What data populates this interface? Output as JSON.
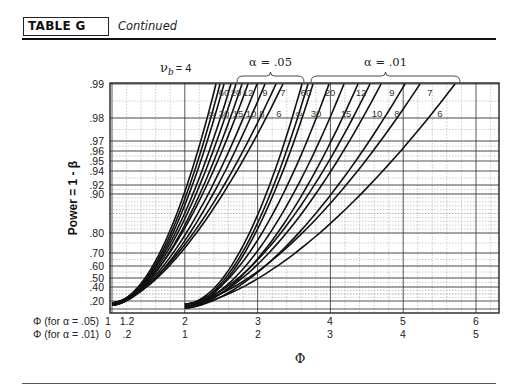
{
  "header": {
    "table_label": "TABLE G",
    "subtitle": "Continued"
  },
  "chart_data": {
    "type": "line",
    "nu_b_label": "ν",
    "nu_b_sub": "b",
    "nu_b_value": "= 4",
    "ylabel": "Power = 1 - β",
    "xlabel": "Φ",
    "x_axis_rows": [
      {
        "label": "Φ (for α = .05)",
        "ticks": [
          "1",
          "1.2",
          "2",
          "3",
          "4",
          "5",
          "6"
        ],
        "values": [
          1,
          1.2,
          2,
          3,
          4,
          5,
          6
        ]
      },
      {
        "label": "Φ (for α = .01)",
        "ticks": [
          "0",
          ".2",
          "1",
          "2",
          "3",
          "4",
          "5"
        ],
        "values": [
          0,
          0.2,
          1,
          2,
          3,
          4,
          5
        ]
      }
    ],
    "y_ticks": [
      ".99",
      ".98",
      ".97",
      ".96",
      ".95",
      ".94",
      ".92",
      ".90",
      ".80",
      ".70",
      ".60",
      ".50",
      ".40",
      ".20"
    ],
    "y_tick_values": [
      0.99,
      0.98,
      0.97,
      0.96,
      0.95,
      0.94,
      0.92,
      0.9,
      0.8,
      0.7,
      0.6,
      0.5,
      0.4,
      0.2
    ],
    "groups": [
      {
        "name": "α = .05",
        "df_top_labels": [
          "60",
          "20",
          "12",
          "9",
          "7"
        ],
        "df_mid_labels": [
          "∞",
          "30",
          "15",
          "10",
          "8",
          "6"
        ],
        "series": [
          {
            "df": "∞",
            "phi_at_power_020": 1.0,
            "phi_at_power_099": 2.42
          },
          {
            "df": "60",
            "phi_at_power_020": 1.0,
            "phi_at_power_099": 2.48
          },
          {
            "df": "30",
            "phi_at_power_020": 1.0,
            "phi_at_power_099": 2.54
          },
          {
            "df": "20",
            "phi_at_power_020": 1.0,
            "phi_at_power_099": 2.62
          },
          {
            "df": "15",
            "phi_at_power_020": 1.0,
            "phi_at_power_099": 2.7
          },
          {
            "df": "12",
            "phi_at_power_020": 1.0,
            "phi_at_power_099": 2.78
          },
          {
            "df": "10",
            "phi_at_power_020": 1.0,
            "phi_at_power_099": 2.87
          },
          {
            "df": "9",
            "phi_at_power_020": 1.0,
            "phi_at_power_099": 2.97
          },
          {
            "df": "8",
            "phi_at_power_020": 1.0,
            "phi_at_power_099": 3.1
          },
          {
            "df": "7",
            "phi_at_power_020": 1.0,
            "phi_at_power_099": 3.26
          },
          {
            "df": "6",
            "phi_at_power_020": 1.0,
            "phi_at_power_099": 3.48
          }
        ]
      },
      {
        "name": "α = .01",
        "df_top_labels": [
          "60",
          "20",
          "12",
          "9",
          "7"
        ],
        "df_mid_labels": [
          "∞",
          "30",
          "15",
          "10",
          "8",
          "6"
        ],
        "series": [
          {
            "df": "∞",
            "phi_at_power_020": 1.0,
            "phi_at_power_099": 2.62
          },
          {
            "df": "60",
            "phi_at_power_020": 1.0,
            "phi_at_power_099": 2.72
          },
          {
            "df": "30",
            "phi_at_power_020": 1.0,
            "phi_at_power_099": 2.83
          },
          {
            "df": "20",
            "phi_at_power_020": 1.0,
            "phi_at_power_099": 2.98
          },
          {
            "df": "15",
            "phi_at_power_020": 1.0,
            "phi_at_power_099": 3.14
          },
          {
            "df": "12",
            "phi_at_power_020": 1.0,
            "phi_at_power_099": 3.32
          },
          {
            "df": "10",
            "phi_at_power_020": 1.0,
            "phi_at_power_099": 3.5
          },
          {
            "df": "9",
            "phi_at_power_020": 1.0,
            "phi_at_power_099": 3.66
          },
          {
            "df": "8",
            "phi_at_power_020": 1.0,
            "phi_at_power_099": 3.88
          },
          {
            "df": "7",
            "phi_at_power_020": 1.0,
            "phi_at_power_099": 4.12
          },
          {
            "df": "6",
            "phi_at_power_020": 1.0,
            "phi_at_power_099": 4.8
          }
        ]
      }
    ],
    "grid": true,
    "legend_position": "top (braces)"
  }
}
